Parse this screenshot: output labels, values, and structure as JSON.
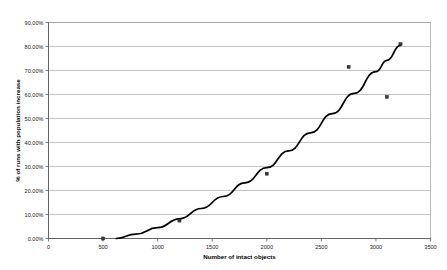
{
  "chart_data": {
    "type": "scatter",
    "title": "",
    "subtitle": "",
    "xlabel": "Number of intact objects",
    "ylabel": "% of runs with population increase",
    "xlim": [
      0,
      3500
    ],
    "ylim": [
      0,
      0.9
    ],
    "grid": true,
    "grid_axis": "y",
    "legend": "none",
    "x_tick_labels": [
      "0",
      "500",
      "1000",
      "1500",
      "2000",
      "2500",
      "3000",
      "3500"
    ],
    "x_ticks": [
      0,
      500,
      1000,
      1500,
      2000,
      2500,
      3000,
      3500
    ],
    "y_tick_labels": [
      "0.00%",
      "10.00%",
      "20.00%",
      "30.00%",
      "40.00%",
      "50.00%",
      "60.00%",
      "70.00%",
      "80.00%",
      "90.00%"
    ],
    "y_ticks": [
      0,
      0.1,
      0.2,
      0.3,
      0.4,
      0.5,
      0.6,
      0.7,
      0.8,
      0.9
    ],
    "series": [
      {
        "name": "observed runs",
        "marker": "square",
        "marker_color": "#3a3a3a",
        "points": [
          {
            "x": 500,
            "y": 0.0
          },
          {
            "x": 1200,
            "y": 0.075
          },
          {
            "x": 2000,
            "y": 0.27
          },
          {
            "x": 2750,
            "y": 0.715
          },
          {
            "x": 3100,
            "y": 0.59
          },
          {
            "x": 3225,
            "y": 0.81
          }
        ]
      },
      {
        "name": "trend curve",
        "marker": "none",
        "line_color": "#000000",
        "points": [
          {
            "x": 620,
            "y": 0.0
          },
          {
            "x": 800,
            "y": 0.018
          },
          {
            "x": 1000,
            "y": 0.045
          },
          {
            "x": 1200,
            "y": 0.082
          },
          {
            "x": 1400,
            "y": 0.125
          },
          {
            "x": 1600,
            "y": 0.175
          },
          {
            "x": 1800,
            "y": 0.232
          },
          {
            "x": 2000,
            "y": 0.295
          },
          {
            "x": 2200,
            "y": 0.365
          },
          {
            "x": 2400,
            "y": 0.44
          },
          {
            "x": 2600,
            "y": 0.52
          },
          {
            "x": 2800,
            "y": 0.605
          },
          {
            "x": 3000,
            "y": 0.695
          },
          {
            "x": 3100,
            "y": 0.742
          },
          {
            "x": 3225,
            "y": 0.805
          }
        ]
      }
    ]
  }
}
